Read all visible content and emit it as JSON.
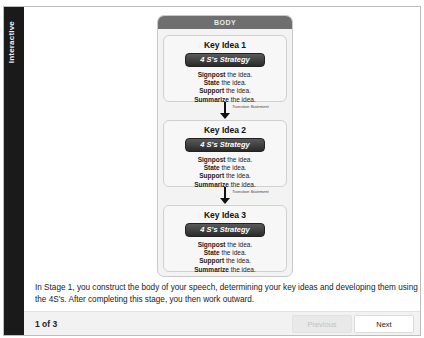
{
  "sidebar": {
    "label": "Interactive"
  },
  "diagram": {
    "header": "BODY",
    "strategy_label": "4 S's Strategy",
    "transition_label": "Transition Statement",
    "ideas": [
      {
        "title": "Key Idea 1",
        "steps": [
          {
            "bold": "Signpost",
            "rest": " the idea."
          },
          {
            "bold": "State",
            "rest": " the idea."
          },
          {
            "bold": "Support",
            "rest": " the idea."
          },
          {
            "bold": "Summarize",
            "rest": " the idea."
          }
        ]
      },
      {
        "title": "Key Idea 2",
        "steps": [
          {
            "bold": "Signpost",
            "rest": " the idea."
          },
          {
            "bold": "State",
            "rest": " the idea."
          },
          {
            "bold": "Support",
            "rest": " the idea."
          },
          {
            "bold": "Summarize",
            "rest": " the idea."
          }
        ]
      },
      {
        "title": "Key Idea 3",
        "steps": [
          {
            "bold": "Signpost",
            "rest": " the idea."
          },
          {
            "bold": "State",
            "rest": " the idea."
          },
          {
            "bold": "Support",
            "rest": " the idea."
          },
          {
            "bold": "Summarize",
            "rest": " the idea."
          }
        ]
      }
    ]
  },
  "description": "In Stage 1, you construct the body of your speech, determining your key ideas and developing them using the 4S's.  After completing this stage, you then work outward.",
  "footer": {
    "page_indicator": "1 of 3",
    "previous_label": "Previous",
    "next_label": "Next"
  }
}
